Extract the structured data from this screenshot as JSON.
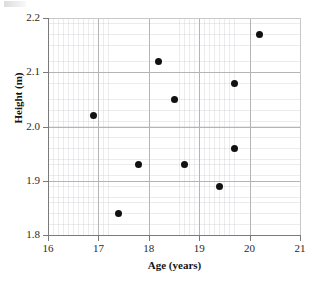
{
  "figure": {
    "artifact_note": "cropped-mark-top-left"
  },
  "chart_data": {
    "type": "scatter",
    "title": "",
    "xlabel": "Age (years)",
    "ylabel": "Height (m)",
    "xlim": [
      16,
      21
    ],
    "ylim": [
      1.8,
      2.2
    ],
    "xticks": [
      16,
      17,
      18,
      19,
      20,
      21
    ],
    "yticks": [
      1.8,
      1.9,
      2.0,
      2.1,
      2.2
    ],
    "xtick_labels": [
      "16",
      "17",
      "18",
      "19",
      "20",
      "21"
    ],
    "ytick_labels": [
      "1.8",
      "1.9",
      "2.0",
      "2.1",
      "2.2"
    ],
    "grid": true,
    "minor_grid": true,
    "legend": null,
    "marker": "circle",
    "marker_color": "#111111",
    "grid_color": "#b4b4b4",
    "x": [
      16.9,
      17.4,
      17.8,
      18.2,
      18.5,
      18.7,
      19.4,
      19.7,
      19.7,
      20.2
    ],
    "y": [
      2.02,
      1.84,
      1.93,
      2.12,
      2.05,
      1.93,
      1.89,
      2.08,
      1.96,
      2.17
    ],
    "points": [
      {
        "x": 16.9,
        "y": 2.02
      },
      {
        "x": 17.4,
        "y": 1.84
      },
      {
        "x": 17.8,
        "y": 1.93
      },
      {
        "x": 18.2,
        "y": 2.12
      },
      {
        "x": 18.5,
        "y": 2.05
      },
      {
        "x": 18.7,
        "y": 1.93
      },
      {
        "x": 19.4,
        "y": 1.89
      },
      {
        "x": 19.7,
        "y": 2.08
      },
      {
        "x": 19.7,
        "y": 1.96
      },
      {
        "x": 20.2,
        "y": 2.17
      }
    ]
  }
}
